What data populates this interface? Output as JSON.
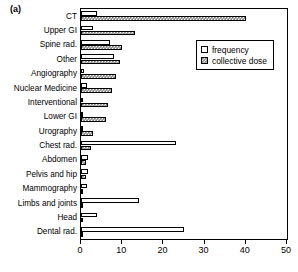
{
  "panel": {
    "label": "(a)"
  },
  "legend": {
    "position": "top-right-inside",
    "entries": [
      {
        "key": "frequency",
        "label": "frequency",
        "swatch": "open-white-square"
      },
      {
        "key": "collective_dose",
        "label": "collective dose",
        "swatch": "hatched-grey-square"
      }
    ]
  },
  "axis": {
    "x": {
      "ticks": [
        0,
        10,
        20,
        30,
        40,
        50
      ],
      "tick_labels": [
        "0",
        "10",
        "20",
        "30",
        "40",
        "50"
      ],
      "min": 0,
      "max": 50
    }
  },
  "chart_data": {
    "type": "bar",
    "orientation": "horizontal",
    "title": "",
    "xlabel": "",
    "ylabel": "",
    "xlim": [
      0,
      50
    ],
    "grid": false,
    "legend_position": "top-right-inside",
    "categories": [
      "CT",
      "Upper GI",
      "Spine rad.",
      "Other",
      "Angiography",
      "Nuclear Medicine",
      "Interventional",
      "Lower GI",
      "Urography",
      "Chest rad.",
      "Abdomen",
      "Pelvis and hip",
      "Mammography",
      "Limbs and joints",
      "Head",
      "Dental rad."
    ],
    "series": [
      {
        "name": "frequency",
        "values": [
          4.0,
          3.0,
          7.0,
          8.0,
          0.7,
          1.5,
          0.4,
          0.5,
          0.6,
          23.0,
          1.6,
          1.7,
          1.4,
          14.0,
          4.0,
          25.0
        ]
      },
      {
        "name": "collective dose",
        "values": [
          40.0,
          13.0,
          10.0,
          9.5,
          8.5,
          7.5,
          6.5,
          6.0,
          3.0,
          2.5,
          1.2,
          1.2,
          0.3,
          0.5,
          0.4,
          0.3
        ]
      }
    ]
  }
}
